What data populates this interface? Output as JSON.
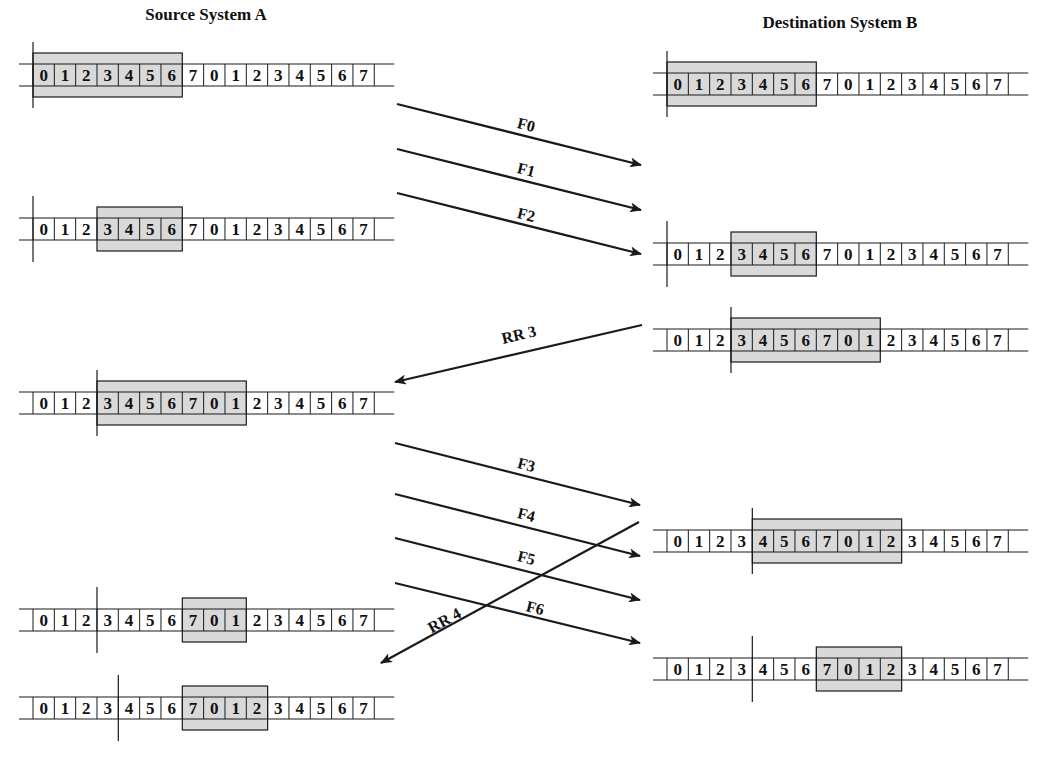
{
  "titles": {
    "source": "Source System A",
    "destination": "Destination System B"
  },
  "colors": {
    "window_fill": "#d9d9d9",
    "line": "#1a1a1a",
    "background": "#ffffff"
  },
  "sequence": [
    "0",
    "1",
    "2",
    "3",
    "4",
    "5",
    "6",
    "7",
    "0",
    "1",
    "2",
    "3",
    "4",
    "5",
    "6",
    "7"
  ],
  "source_rows": [
    {
      "y": 75,
      "window_start": 0,
      "window_end": 7,
      "cursor": 0,
      "note": "Initial: can send 0-6"
    },
    {
      "y": 229,
      "window_start": 3,
      "window_end": 7,
      "cursor": 0,
      "note": "After sending F0-F2"
    },
    {
      "y": 403,
      "window_start": 3,
      "window_end": 10,
      "cursor": 3,
      "note": "After RR 3"
    },
    {
      "y": 620,
      "window_start": 7,
      "window_end": 10,
      "cursor": 3,
      "note": "After sending F3-F6"
    },
    {
      "y": 708,
      "window_start": 7,
      "window_end": 11,
      "cursor": 4,
      "note": "After RR 4"
    }
  ],
  "dest_rows": [
    {
      "y": 84,
      "window_start": 0,
      "window_end": 7,
      "cursor": 0,
      "note": "Initial: can receive 0-6"
    },
    {
      "y": 254,
      "window_start": 3,
      "window_end": 7,
      "cursor": 0,
      "note": "After receiving F0-F2"
    },
    {
      "y": 340,
      "window_start": 3,
      "window_end": 10,
      "cursor": 3,
      "note": "After sending RR 3"
    },
    {
      "y": 541,
      "window_start": 4,
      "window_end": 11,
      "cursor": 4,
      "note": "After sending RR 4"
    },
    {
      "y": 669,
      "window_start": 7,
      "window_end": 11,
      "cursor": 4,
      "note": "After receiving F4-F6"
    }
  ],
  "arrows": [
    {
      "label": "F0",
      "x1": 397,
      "y1": 104,
      "x2": 641,
      "y2": 165,
      "lx": 525,
      "ly": 130,
      "direction": "A-to-B"
    },
    {
      "label": "F1",
      "x1": 397,
      "y1": 149,
      "x2": 641,
      "y2": 210,
      "lx": 525,
      "ly": 175,
      "direction": "A-to-B"
    },
    {
      "label": "F2",
      "x1": 397,
      "y1": 193,
      "x2": 641,
      "y2": 254,
      "lx": 525,
      "ly": 220,
      "direction": "A-to-B"
    },
    {
      "label": "RR 3",
      "x1": 642,
      "y1": 325,
      "x2": 395,
      "y2": 382,
      "lx": 520,
      "ly": 340,
      "direction": "B-to-A"
    },
    {
      "label": "F3",
      "x1": 395,
      "y1": 443,
      "x2": 640,
      "y2": 505,
      "lx": 525,
      "ly": 470,
      "direction": "A-to-B"
    },
    {
      "label": "F4",
      "x1": 395,
      "y1": 494,
      "x2": 640,
      "y2": 556,
      "lx": 525,
      "ly": 520,
      "direction": "A-to-B"
    },
    {
      "label": "F5",
      "x1": 395,
      "y1": 538,
      "x2": 640,
      "y2": 600,
      "lx": 525,
      "ly": 563,
      "direction": "A-to-B"
    },
    {
      "label": "F6",
      "x1": 395,
      "y1": 583,
      "x2": 640,
      "y2": 643,
      "lx": 534,
      "ly": 613,
      "direction": "A-to-B"
    },
    {
      "label": "RR 4",
      "x1": 639,
      "y1": 522,
      "x2": 381,
      "y2": 663,
      "lx": 447,
      "ly": 625,
      "direction": "B-to-A"
    }
  ],
  "layout": {
    "cell_width": 21.33,
    "cell_height": 22,
    "source_x0": 33,
    "dest_x0": 667,
    "track_overhang_left": 14,
    "track_overhang_right": 20,
    "window_pad": 11
  }
}
